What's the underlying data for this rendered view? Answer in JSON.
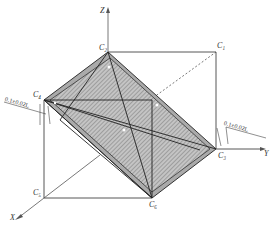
{
  "figure": {
    "axes": {
      "z": "Z",
      "y": "Y",
      "x": "X"
    },
    "points": {
      "c1": "C₁",
      "c2": "C₂",
      "c3": "C₃",
      "c4": "C₄",
      "c5": "C₅",
      "c6": "C₆"
    },
    "tolerances": {
      "left": "0.1±0.02L",
      "right": "0.1±0.02L"
    },
    "colors": {
      "line": "#333333",
      "hatch": "#888888",
      "fill": "#b8b8b8"
    }
  }
}
